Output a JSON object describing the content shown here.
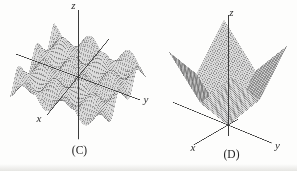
{
  "figure": {
    "background": "#fdfdfc"
  },
  "chart_data": [
    {
      "type": "surface",
      "title": "(C)",
      "description": "Egg-crate wave surface with alternating rows of peaks and valleys, consistent with z = sin x * sin y",
      "formula": "z = sin x * sin y",
      "axis_labels": {
        "x": "x",
        "y": "y",
        "z": "z"
      },
      "domain": {
        "x": [
          -1,
          1
        ],
        "y": [
          -1,
          1
        ]
      },
      "z_range": [
        -0.35,
        0.35
      ],
      "func_id": "eggcrate",
      "omega": 7.5,
      "amplitude": 0.35,
      "grid": 46,
      "projection": {
        "origin": [
          78,
          77
        ],
        "ux": [
          -22,
          27
        ],
        "uy": [
          46,
          17
        ],
        "zscale": 32
      },
      "axes": {
        "x": [
          -1.4,
          1.4
        ],
        "y": [
          -1.35,
          1.35
        ],
        "z": [
          -1.95,
          2.1
        ]
      },
      "style": {
        "mesh_fill": "#dcdcdc",
        "mesh_line": "rgba(70,70,70,0.5)",
        "axis_color": "#3c3c3c"
      }
    },
    {
      "type": "surface",
      "title": "(D)",
      "description": "Four-winged pyramid cone rising from the origin, consistent with z = |x| + |y|",
      "formula": "z = |x| + |y|",
      "axis_labels": {
        "x": "x",
        "y": "y",
        "z": "z"
      },
      "domain": {
        "x": [
          -1,
          1
        ],
        "y": [
          -1,
          1
        ]
      },
      "z_range": [
        0,
        2
      ],
      "func_id": "abs_pyramid",
      "grid": 48,
      "projection": {
        "origin": [
          228,
          125
        ],
        "ux": [
          -27.5,
          16
        ],
        "uy": [
          31.5,
          13
        ],
        "zscale": 76
      },
      "axes": {
        "x": [
          -0.35,
          1.25
        ],
        "y": [
          -1.75,
          1.4
        ],
        "z": [
          -0.145,
          1.45
        ]
      },
      "style": {
        "mesh_fill": "#dcdcdc",
        "mesh_line": "rgba(70,70,70,0.5)",
        "axis_color": "#3c3c3c"
      }
    }
  ]
}
